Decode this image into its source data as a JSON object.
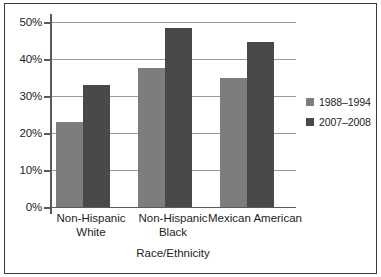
{
  "chart_data": {
    "type": "bar",
    "title": "",
    "subtitle": "",
    "xlabel": "Race/Ethnicity",
    "ylabel": "",
    "categories": [
      "Non-Hispanic White",
      "Non-Hispanic Black",
      "Mexican American"
    ],
    "category_lines": [
      [
        "Non-Hispanic",
        "White"
      ],
      [
        "Non-Hispanic",
        "Black"
      ],
      [
        "Mexican American",
        ""
      ]
    ],
    "series": [
      {
        "name": "1988–1994",
        "color": "#7d7d7d",
        "values": [
          23.0,
          37.6,
          34.9
        ]
      },
      {
        "name": "2007–2008",
        "color": "#494949",
        "values": [
          32.9,
          48.4,
          44.6
        ]
      }
    ],
    "ylim": [
      0,
      50
    ],
    "yticks": [
      0,
      10,
      20,
      30,
      40,
      50
    ],
    "ytick_labels": [
      "0%",
      "10%",
      "20%",
      "30%",
      "40%",
      "50%"
    ],
    "grid": true,
    "grid_axis": "y",
    "legend_position": "right",
    "bar_width_px": 27,
    "colors": {
      "frame": "#3a3a3a",
      "axis": "#5a5a5a",
      "grid": "#9a9a9a",
      "text": "#1d1d1d",
      "background": "#ffffff"
    }
  }
}
